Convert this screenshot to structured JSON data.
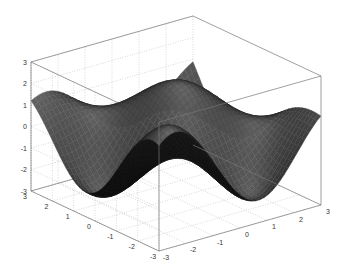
{
  "chart_data": {
    "type": "surface",
    "title": "",
    "xlabel": "",
    "ylabel": "",
    "zlabel": "",
    "xlim": [
      -3,
      3
    ],
    "ylim": [
      -3,
      3
    ],
    "zlim": [
      -3,
      3
    ],
    "x_ticks": [
      "-3",
      "-2",
      "-1",
      "0",
      "1",
      "2",
      "3"
    ],
    "y_ticks": [
      "-3",
      "-2",
      "-1",
      "0",
      "1",
      "2",
      "3"
    ],
    "z_ticks": [
      "-3",
      "-2",
      "-1",
      "0",
      "1",
      "2",
      "3"
    ],
    "grid": true,
    "colormap": "gray",
    "surface_description": "Smooth oscillating surface over [-3,3]x[-3,3] with peaks near z=2.5 at the left, back-center and right, and a deep trough near z=-3 at the front-center",
    "approx_peaks": [
      {
        "x": -3,
        "y": 1.5,
        "z": 2.5
      },
      {
        "x": -1,
        "y": 0,
        "z": 2.6
      },
      {
        "x": 2,
        "y": -1,
        "z": 2.6
      }
    ],
    "approx_troughs": [
      {
        "x": -1.5,
        "y": -2.5,
        "z": -3
      }
    ]
  },
  "colors": {
    "background": "#ffffff",
    "axis_box": "#777777",
    "grid": "#c8c8c8",
    "surface_dark": "#0a0a0a",
    "surface_light": "#8a8a8a"
  }
}
